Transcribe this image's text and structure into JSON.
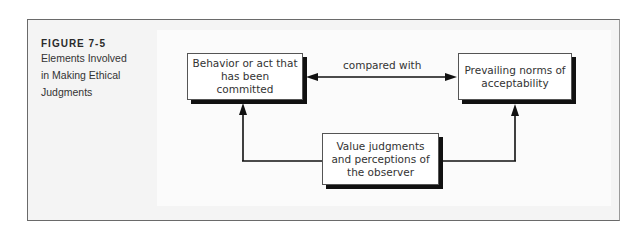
{
  "figure": {
    "label": "FIGURE 7-5",
    "title_lines": [
      "Elements Involved",
      "in Making Ethical",
      "Judgments"
    ]
  },
  "diagram": {
    "nodes": {
      "behavior": {
        "text": "Behavior or act that has been committed"
      },
      "norms": {
        "text": "Prevailing norms of acceptability"
      },
      "judgments": {
        "text": "Value judgments and perceptions of the observer"
      }
    },
    "edges": {
      "compare_label": "compared with"
    }
  },
  "colors": {
    "frame_border": "#6a6a6a",
    "shadow": "#111111",
    "line": "#111111"
  }
}
